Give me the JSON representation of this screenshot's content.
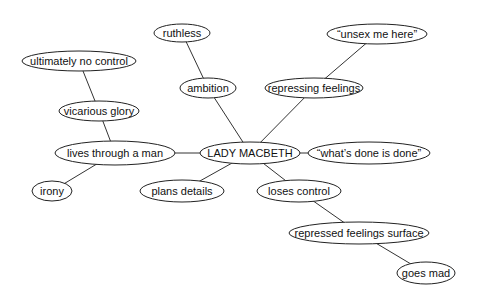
{
  "diagram": {
    "type": "concept-map",
    "central": "lady_macbeth",
    "nodes": [
      {
        "id": "ruthless",
        "label": "ruthless",
        "cx": 182,
        "cy": 33,
        "rx": 28,
        "ry": 9
      },
      {
        "id": "ultimately_no_control",
        "label": "ultimately no control",
        "cx": 79,
        "cy": 61,
        "rx": 57,
        "ry": 10
      },
      {
        "id": "ambition",
        "label": "ambition",
        "cx": 208,
        "cy": 88,
        "rx": 28,
        "ry": 10
      },
      {
        "id": "unsex_me_here",
        "label": "“unsex me here”",
        "cx": 377,
        "cy": 34,
        "rx": 50,
        "ry": 10
      },
      {
        "id": "repressing_feelings",
        "label": "repressing feelings",
        "cx": 314,
        "cy": 88,
        "rx": 49,
        "ry": 10
      },
      {
        "id": "vicarious_glory",
        "label": "vicarious glory",
        "cx": 99,
        "cy": 111,
        "rx": 40,
        "ry": 10
      },
      {
        "id": "lives_through_a_man",
        "label": "lives through a man",
        "cx": 115,
        "cy": 153,
        "rx": 60,
        "ry": 12
      },
      {
        "id": "lady_macbeth",
        "label": "LADY MACBETH",
        "cx": 250,
        "cy": 153,
        "rx": 50,
        "ry": 11
      },
      {
        "id": "whats_done_is_done",
        "label": "“what’s done is done”",
        "cx": 369,
        "cy": 153,
        "rx": 61,
        "ry": 11
      },
      {
        "id": "irony",
        "label": "irony",
        "cx": 52,
        "cy": 191,
        "rx": 20,
        "ry": 10
      },
      {
        "id": "plans_details",
        "label": "plans details",
        "cx": 182,
        "cy": 191,
        "rx": 42,
        "ry": 11
      },
      {
        "id": "loses_control",
        "label": "loses control",
        "cx": 299,
        "cy": 191,
        "rx": 42,
        "ry": 11
      },
      {
        "id": "repressed_feelings_surface",
        "label": "repressed feelings surface",
        "cx": 359,
        "cy": 233,
        "rx": 70,
        "ry": 11
      },
      {
        "id": "goes_mad",
        "label": "goes mad",
        "cx": 426,
        "cy": 273,
        "rx": 29,
        "ry": 11
      }
    ],
    "edges": [
      {
        "from": "ruthless",
        "to": "ambition"
      },
      {
        "from": "ambition",
        "to": "lady_macbeth"
      },
      {
        "from": "unsex_me_here",
        "to": "repressing_feelings"
      },
      {
        "from": "repressing_feelings",
        "to": "lady_macbeth"
      },
      {
        "from": "ultimately_no_control",
        "to": "vicarious_glory"
      },
      {
        "from": "vicarious_glory",
        "to": "lives_through_a_man"
      },
      {
        "from": "lives_through_a_man",
        "to": "lady_macbeth"
      },
      {
        "from": "lady_macbeth",
        "to": "whats_done_is_done"
      },
      {
        "from": "lives_through_a_man",
        "to": "irony"
      },
      {
        "from": "lady_macbeth",
        "to": "plans_details"
      },
      {
        "from": "lady_macbeth",
        "to": "loses_control"
      },
      {
        "from": "loses_control",
        "to": "repressed_feelings_surface"
      },
      {
        "from": "repressed_feelings_surface",
        "to": "goes_mad"
      }
    ]
  }
}
